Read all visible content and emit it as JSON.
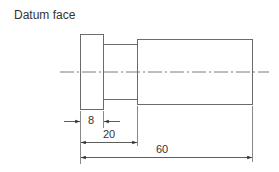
{
  "title": "Datum face",
  "colors": {
    "line": "#6b6b6b",
    "text": "#333333",
    "background": "#ffffff"
  },
  "part": {
    "flange": {
      "x1": 80,
      "x2": 103,
      "y1": 34,
      "y2": 109
    },
    "neck": {
      "x1": 103,
      "x2": 137,
      "y1": 44,
      "y2": 99
    },
    "body": {
      "x1": 137,
      "x2": 252,
      "y1": 39,
      "y2": 104
    },
    "centerline": {
      "x1": 60,
      "x2": 269,
      "y": 72
    }
  },
  "dimensions": [
    {
      "label": "8",
      "from": "datum face",
      "to": "flange end",
      "value": 8
    },
    {
      "label": "20",
      "from": "datum face",
      "to": "neck end",
      "value": 20
    },
    {
      "label": "60",
      "from": "datum face",
      "to": "body end",
      "value": 60
    }
  ]
}
